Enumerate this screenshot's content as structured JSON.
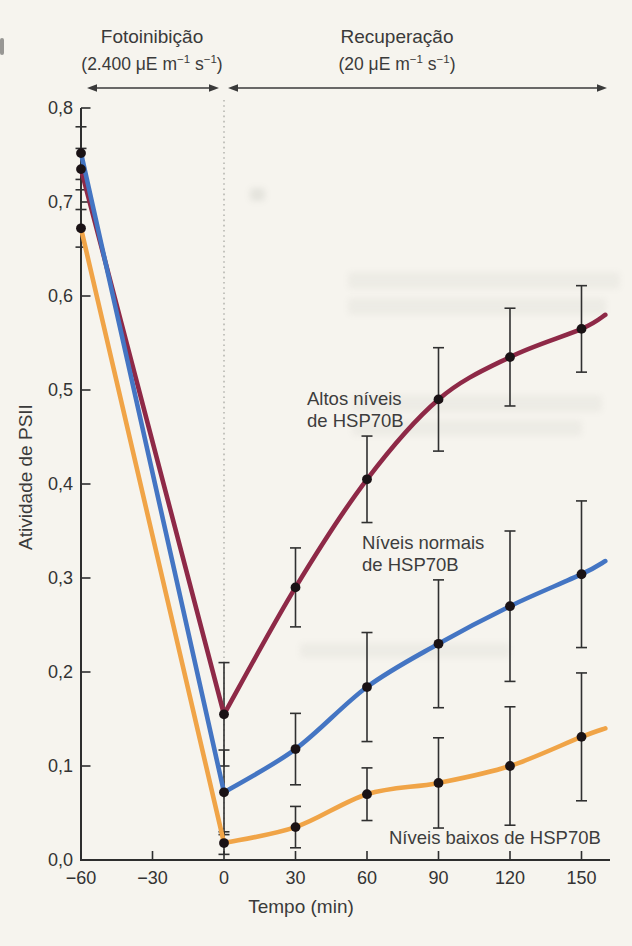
{
  "figure": {
    "background_color": "#f6f4ee",
    "text_color": "#3a3a3a",
    "phases": [
      {
        "name": "Fotoinibição",
        "unit_prefix": "(2.400 μE m",
        "unit_sup1": "−1",
        "unit_mid": " s",
        "unit_sup2": "−1",
        "unit_suffix": ")",
        "span_minutes": [
          -60,
          0
        ]
      },
      {
        "name": "Recuperação",
        "unit_prefix": "(20 μE m",
        "unit_sup1": "−1",
        "unit_mid": " s",
        "unit_sup2": "−1",
        "unit_suffix": ")",
        "span_minutes": [
          0,
          160
        ]
      }
    ]
  },
  "chart_data": {
    "type": "line",
    "title": "",
    "xlabel": "Tempo (min)",
    "ylabel": "Atividade de PSII",
    "xlim": [
      -60,
      162
    ],
    "ylim": [
      0,
      0.8
    ],
    "x_ticks": [
      -60,
      -30,
      0,
      30,
      60,
      90,
      120,
      150
    ],
    "x_tick_labels": [
      "−60",
      "−30",
      "0",
      "30",
      "60",
      "90",
      "120",
      "150"
    ],
    "y_ticks": [
      0,
      0.1,
      0.2,
      0.3,
      0.4,
      0.5,
      0.6,
      0.7,
      0.8
    ],
    "y_tick_labels": [
      "0,0",
      "0,1",
      "0,2",
      "0,3",
      "0,4",
      "0,5",
      "0,6",
      "0,7",
      "0,8"
    ],
    "grid": false,
    "legend_position": "inline-annotations",
    "phase_divider_x": 0,
    "divider_style": "dotted",
    "axis_color": "#2e2e2e",
    "error_bar_color": "#303030",
    "point_color": "#1a1215",
    "arrow_color": "#3a3a3a",
    "series": [
      {
        "name": "Altos níveis de HSP70B",
        "color": "#8e2947",
        "x": [
          -60,
          0,
          30,
          60,
          90,
          120,
          150
        ],
        "y": [
          0.735,
          0.155,
          0.29,
          0.405,
          0.49,
          0.535,
          0.565
        ],
        "err": [
          0.022,
          0.055,
          0.042,
          0.046,
          0.055,
          0.052,
          0.046
        ],
        "extend_to": {
          "x": 160,
          "y": 0.58
        },
        "label_lines": [
          "Altos níveis",
          "de HSP70B"
        ],
        "label_pos": {
          "left": 307,
          "top": 388
        }
      },
      {
        "name": "Níveis normais de HSP70B",
        "color": "#4475c3",
        "x": [
          -60,
          0,
          30,
          60,
          90,
          120,
          150
        ],
        "y": [
          0.752,
          0.072,
          0.118,
          0.184,
          0.23,
          0.27,
          0.304
        ],
        "err": [
          0.028,
          0.045,
          0.038,
          0.058,
          0.068,
          0.08,
          0.078
        ],
        "extend_to": {
          "x": 160,
          "y": 0.318
        },
        "label_lines": [
          "Níveis normais",
          "de HSP70B"
        ],
        "label_pos": {
          "left": 362,
          "top": 532
        }
      },
      {
        "name": "Níveis baixos de HSP70B",
        "color": "#f0a447",
        "x": [
          -60,
          0,
          30,
          60,
          90,
          120,
          150
        ],
        "y": [
          0.672,
          0.018,
          0.035,
          0.07,
          0.082,
          0.1,
          0.131
        ],
        "err": [
          0.02,
          0.012,
          0.022,
          0.028,
          0.048,
          0.063,
          0.068
        ],
        "extend_to": {
          "x": 160,
          "y": 0.14
        },
        "label_lines": [
          "Níveis baixos de HSP70B"
        ],
        "label_pos": {
          "left": 389,
          "top": 827
        }
      }
    ]
  }
}
